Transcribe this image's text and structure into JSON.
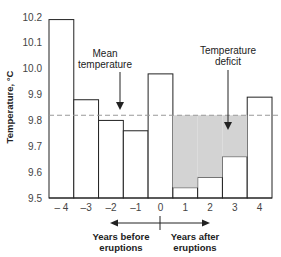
{
  "chart_data": {
    "type": "bar",
    "title": "",
    "xlabel": "",
    "ylabel": "Temperature, °C",
    "ylim": [
      9.5,
      10.2
    ],
    "yticks": [
      "10.2",
      "10.1",
      "10.0",
      "9.9",
      "9.8",
      "9.7",
      "9.6",
      "9.5"
    ],
    "categories": [
      "– 4",
      "–3",
      "–2",
      "–1",
      "0",
      "1",
      "2",
      "3",
      "4"
    ],
    "values": [
      10.19,
      9.88,
      9.8,
      9.76,
      9.98,
      9.54,
      9.58,
      9.66,
      9.89
    ],
    "mean_temperature": 9.82,
    "grid": false,
    "annotations": {
      "mean": [
        "Mean",
        "temperature"
      ],
      "deficit": [
        "Temperature",
        "deficit"
      ],
      "before": [
        "Years before",
        "eruptions"
      ],
      "after": [
        "Years after",
        "eruptions"
      ]
    },
    "colors": {
      "bar_fill": "#ffffff",
      "bar_stroke": "#222222",
      "deficit_fill": "#d3d3d3",
      "mean_line": "#999999"
    }
  }
}
